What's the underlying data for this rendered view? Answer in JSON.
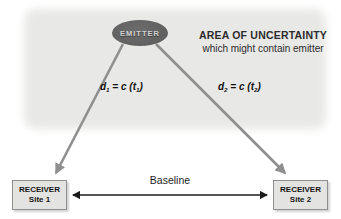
{
  "diagram": {
    "emitter": {
      "label": "EMITTER"
    },
    "uncertainty": {
      "line1": "AREA OF UNCERTAINTY",
      "line2": "which might contain emitter"
    },
    "distances": [
      {
        "seg1": "d",
        "sub1": "1",
        "seg2": " = c (t",
        "sub2": "1",
        "seg3": ")"
      },
      {
        "seg1": "d",
        "sub1": "2",
        "seg2": " = c (t",
        "sub2": "2",
        "seg3": ")"
      }
    ],
    "receivers": [
      {
        "line1": "RECEIVER",
        "line2": "Site 1"
      },
      {
        "line1": "RECEIVER",
        "line2": "Site 2"
      }
    ],
    "baseline_label": "Baseline",
    "colors": {
      "uncertainty_fill": "#e8e8e6",
      "emitter_fill": "#616161",
      "emitter_text": "#d3d3d3",
      "signal_arrow": "#8f8f8f",
      "baseline_arrow": "#1c1c1c",
      "receiver_box_fill": "#e3e3e1",
      "receiver_box_border": "#8f8f8f"
    }
  }
}
